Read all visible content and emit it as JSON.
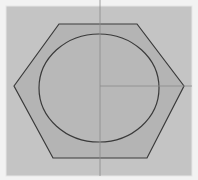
{
  "diagram": {
    "title": "",
    "canvas": {
      "x": 6,
      "y": 6,
      "width": 186,
      "height": 170,
      "fill": "#c4c4c4",
      "border": "#e6e6e6"
    },
    "hexagon": {
      "points": "14,86 59,24 137,24 184,86 147,158 53,158",
      "fill": "#b4b4b4",
      "stroke": "#3a3a3a"
    },
    "ellipse": {
      "cx": 99,
      "cy": 88,
      "rx": 60,
      "ry": 54,
      "fill": "#b8b8b8",
      "stroke": "#3a3a3a"
    },
    "axes": {
      "vertical": {
        "x": 100,
        "y1": 0,
        "y2": 176,
        "stroke": "#8a8a8a"
      },
      "horizontal": {
        "y": 86,
        "x1": 100,
        "x2": 192,
        "stroke": "#8a8a8a"
      }
    }
  }
}
